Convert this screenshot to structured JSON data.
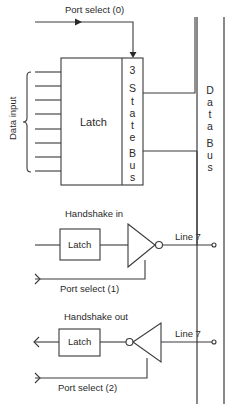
{
  "diagram": {
    "port_select_0": {
      "label": "Port select (0)"
    },
    "data_input": {
      "label": "Data input",
      "line_count": 8
    },
    "main_latch": {
      "label": "Latch"
    },
    "three_state": {
      "chars": [
        "3",
        "S",
        "t",
        "a",
        "t",
        "e",
        "B",
        "u",
        "s"
      ]
    },
    "data_bus": {
      "chars": [
        "D",
        "a",
        "t",
        "a",
        "B",
        "u",
        "s"
      ]
    },
    "handshake_in": {
      "title": "Handshake in",
      "latch_label": "Latch",
      "line_label": "Line 7",
      "port_select_label": "Port select (1)"
    },
    "handshake_out": {
      "title": "Handshake out",
      "latch_label": "Latch",
      "line_label": "Line 7",
      "port_select_label": "Port select (2)"
    },
    "colors": {
      "line": "#3a3a3a",
      "text": "#2a2a2a",
      "background": "#ffffff"
    }
  }
}
